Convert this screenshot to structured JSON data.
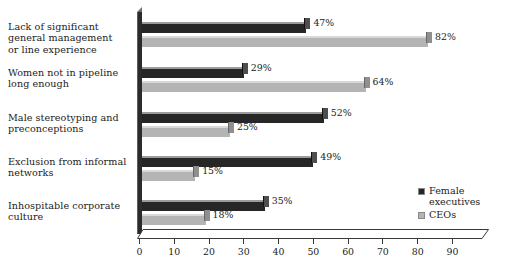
{
  "chart_data": {
    "type": "bar",
    "orientation": "horizontal",
    "title": "",
    "subtitle": "",
    "xlabel": "",
    "ylabel": "",
    "xlim": [
      0,
      97
    ],
    "xticks": [
      0,
      10,
      20,
      30,
      40,
      50,
      60,
      70,
      80,
      90
    ],
    "tick_labels": [
      "0",
      "10",
      "20",
      "30",
      "40",
      "50",
      "60",
      "70",
      "80",
      "90"
    ],
    "grid": false,
    "value_suffix": "%",
    "legend_position": "bottom-right",
    "categories": [
      "Lack of significant\ngeneral management\nor line experience",
      "Women not in pipeline\nlong enough",
      "Male stereotyping and\npreconceptions",
      "Exclusion from informal\nnetworks",
      "Inhospitable corporate\nculture"
    ],
    "series": [
      {
        "name": "Female\nexecutives",
        "legend_label": "Female\nexecutives",
        "color": "#262626",
        "values": [
          47,
          29,
          52,
          49,
          35
        ],
        "value_labels": [
          "47%",
          "29%",
          "52%",
          "49%",
          "35%"
        ]
      },
      {
        "name": "CEOs",
        "legend_label": "CEOs",
        "color": "#b4b4b4",
        "values": [
          82,
          64,
          25,
          15,
          18
        ],
        "value_labels": [
          "82%",
          "64%",
          "25%",
          "15%",
          "18%"
        ]
      }
    ]
  },
  "legend": {
    "items": [
      {
        "label": "Female\nexecutives",
        "swatch": "dark"
      },
      {
        "label": "CEOs",
        "swatch": "light"
      }
    ]
  }
}
